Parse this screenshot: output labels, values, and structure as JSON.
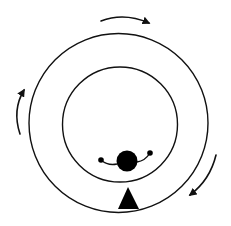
{
  "diagram": {
    "title": "",
    "colors": {
      "stroke": "#111111",
      "fill": "#000000",
      "background": "#ffffff"
    },
    "outer_ring": {
      "cx": 118.5,
      "cy": 123,
      "r": 89.5
    },
    "inner_ring": {
      "cx": 120,
      "cy": 124.5,
      "r": 57.5
    },
    "ball": {
      "cx": 127,
      "cy": 161,
      "r": 10.5
    },
    "arm_dots": [
      {
        "cx": 101,
        "cy": 160,
        "r": 2.8
      },
      {
        "cx": 150,
        "cy": 153,
        "r": 2.8
      }
    ],
    "wedge": {
      "apex": [
        128,
        187
      ],
      "base_left": [
        118,
        209
      ],
      "base_right": [
        139,
        209
      ]
    },
    "rotation_arrows": [
      {
        "position": "top",
        "direction": "clockwise"
      },
      {
        "position": "left",
        "direction": "clockwise"
      },
      {
        "position": "bottom-right",
        "direction": "clockwise"
      }
    ]
  }
}
